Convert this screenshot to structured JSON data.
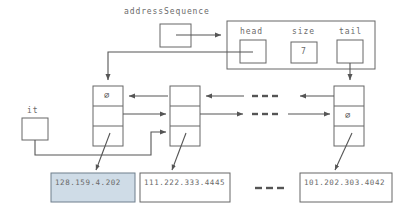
{
  "diagram": {
    "variables": [
      {
        "name": "addressSequence",
        "label": "addressSequence"
      },
      {
        "name": "it",
        "label": "it"
      }
    ],
    "container": {
      "fields": [
        {
          "label": "head",
          "value": ""
        },
        {
          "label": "size",
          "value": "7"
        },
        {
          "label": "tail",
          "value": ""
        }
      ]
    },
    "nodes": [
      {
        "id": "node-head",
        "prev": "null",
        "next": "link",
        "data": "link",
        "null_glyph": "⌀"
      },
      {
        "id": "node-second",
        "prev": "link",
        "next": "link",
        "data": "link",
        "null_glyph": ""
      },
      {
        "id": "node-tail",
        "prev": "link",
        "next": "null",
        "data": "link",
        "null_glyph": "⌀"
      }
    ],
    "data_boxes": [
      {
        "id": "data-box-1",
        "text": "128.159.4.202",
        "highlighted": true,
        "color": "#cfdce7"
      },
      {
        "id": "data-box-2",
        "text": "111.222.333.4445",
        "highlighted": false,
        "color": "#ffffff"
      },
      {
        "id": "data-box-3",
        "text": "101.202.303.4042",
        "highlighted": false,
        "color": "#ffffff"
      }
    ],
    "ellipses": [
      {
        "id": "ellipsis-upper",
        "text": "---"
      },
      {
        "id": "ellipsis-lower",
        "text": "---"
      },
      {
        "id": "ellipsis-data",
        "text": "---"
      }
    ],
    "colors": {
      "stroke": "#555555",
      "text": "#6a6a6a",
      "highlight_fill": "#cfdce7",
      "background": "#ffffff"
    }
  }
}
